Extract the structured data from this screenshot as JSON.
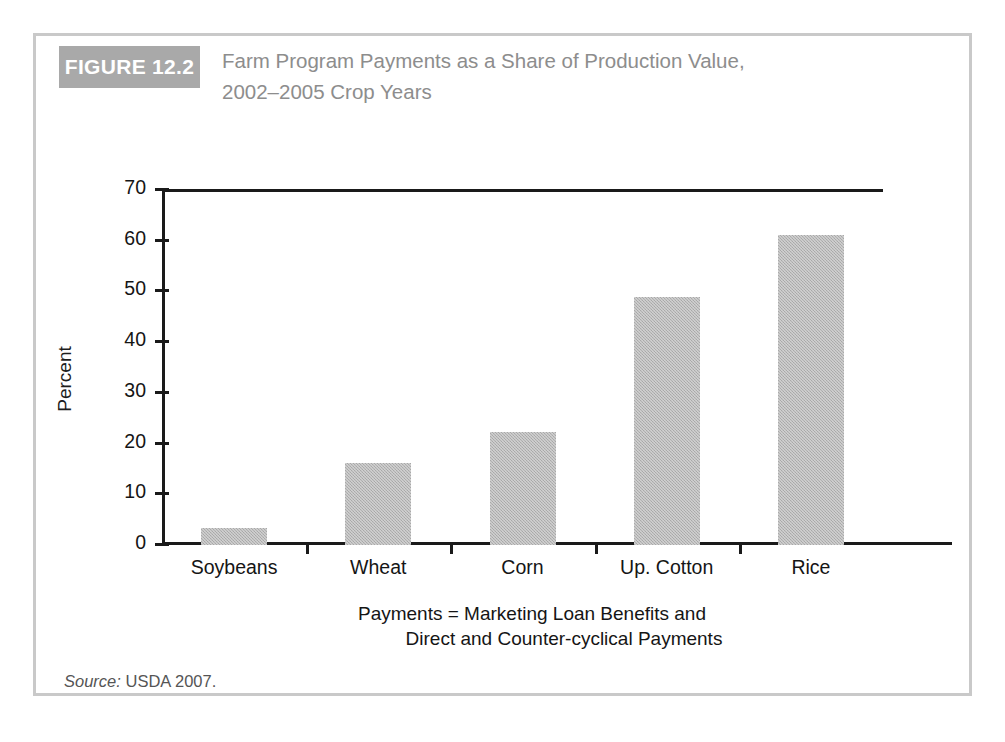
{
  "figure": {
    "badge_label": "FIGURE 12.2",
    "title_line1": "Farm Program Payments as a Share of Production Value,",
    "title_line2": "2002–2005 Crop Years",
    "source_prefix": "Source:",
    "source_text": " USDA 2007."
  },
  "colors": {
    "badge_background": "#a9a9a9",
    "badge_text": "#ffffff",
    "title_text": "#8d8d8d",
    "card_border": "#c9c9c9",
    "axis": "#1a1a1a",
    "bar_fill": "#b3b3b3",
    "label_text": "#151515"
  },
  "chart_data": {
    "type": "bar",
    "title": "Farm Program Payments as a Share of Production Value, 2002–2005 Crop Years",
    "subtitle": "",
    "categories": [
      "Soybeans",
      "Wheat",
      "Corn",
      "Up. Cotton",
      "Rice"
    ],
    "values": [
      3.3,
      16.1,
      22.3,
      48.9,
      61.2
    ],
    "xlabel": "",
    "ylabel": "Percent",
    "ylim": [
      0,
      70
    ],
    "yticks": [
      0,
      10,
      20,
      30,
      40,
      50,
      60,
      70
    ],
    "ytick_labels": [
      "0",
      "10",
      "20",
      "30",
      "40",
      "50",
      "60",
      "70"
    ],
    "grid": false,
    "legend": "none",
    "annotations": [
      "Payments = Marketing Loan Benefits and",
      "Direct and Counter-cyclical Payments"
    ],
    "source": "Source: USDA 2007."
  }
}
